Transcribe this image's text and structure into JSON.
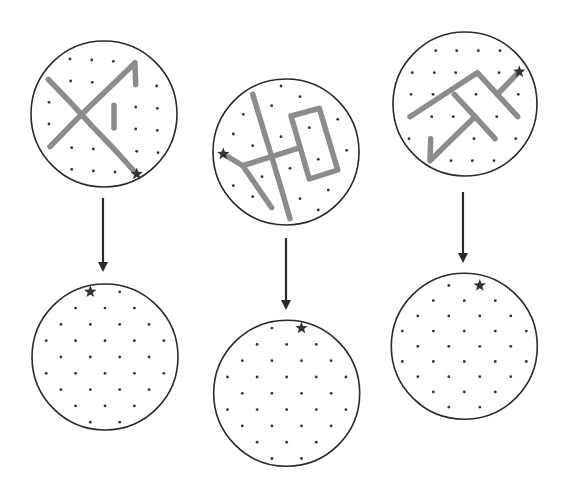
{
  "figure": {
    "width": 565,
    "height": 495,
    "colors": {
      "circle_stroke": "#2a2a2a",
      "dot": "#333333",
      "path_line": "#8c8c8c",
      "star": "#333333",
      "arrow": "#2a2a2a"
    },
    "columns": [
      {
        "id": "col-1",
        "top": {
          "center": [
            104,
            114
          ],
          "r": 73,
          "dots": [
            [
              70,
              59
            ],
            [
              91.7,
              60
            ],
            [
              113.3,
              61.3
            ],
            [
              135,
              62.7
            ],
            [
              48.3,
              79.3
            ],
            [
              70.7,
              81
            ],
            [
              92.3,
              82.3
            ],
            [
              114,
              83.3
            ],
            [
              135.7,
              84.7
            ],
            [
              156.7,
              86
            ],
            [
              49,
              102.3
            ],
            [
              70.7,
              102.7
            ],
            [
              92.3,
              104
            ],
            [
              114,
              105.3
            ],
            [
              135.7,
              107
            ],
            [
              157.3,
              108.3
            ],
            [
              49,
              124
            ],
            [
              70.7,
              125.3
            ],
            [
              92.3,
              126.3
            ],
            [
              114,
              128
            ],
            [
              135.7,
              129
            ],
            [
              157.3,
              130.3
            ],
            [
              50,
              146.7
            ],
            [
              71.7,
              147.7
            ],
            [
              93.3,
              149
            ],
            [
              115,
              150
            ],
            [
              136.7,
              151.3
            ],
            [
              158,
              152.7
            ],
            [
              71.7,
              169.3
            ],
            [
              93.3,
              171
            ],
            [
              115,
              172
            ]
          ],
          "paths": [
            [
              [
                48.3,
                79.3
              ],
              [
                70.7,
                102.7
              ],
              [
                92.3,
                126.3
              ],
              [
                115,
                150
              ],
              [
                136.7,
                174
              ]
            ],
            [
              [
                50,
                146.7
              ],
              [
                70.7,
                125.3
              ],
              [
                92.3,
                104
              ],
              [
                114,
                83.3
              ],
              [
                135,
                62.7
              ],
              [
                135.7,
                84.7
              ]
            ],
            [
              [
                114,
                105.3
              ],
              [
                114,
                128
              ]
            ]
          ],
          "star": [
            136.7,
            174
          ]
        },
        "arrow": {
          "x": 103,
          "y1": 198,
          "y2": 272
        },
        "bottom": {
          "center": [
            105,
            357
          ],
          "r": 73,
          "step": [
            14.7,
            16.3
          ],
          "star_rc": [
            -1,
            -4
          ]
        }
      },
      {
        "id": "col-2",
        "top": {
          "center": [
            286,
            152
          ],
          "r": 73,
          "dots": [
            [
              281,
              86
            ],
            [
              252.7,
              94.3
            ],
            [
              300,
              96.7
            ],
            [
              271.7,
              105.7
            ],
            [
              319.3,
              108.3
            ],
            [
              243.3,
              114.3
            ],
            [
              291,
              116
            ],
            [
              337.7,
              119.3
            ],
            [
              262,
              125
            ],
            [
              309.3,
              127.7
            ],
            [
              233.3,
              134
            ],
            [
              281,
              136.7
            ],
            [
              328.3,
              139.3
            ],
            [
              252.7,
              145.7
            ],
            [
              300,
              147.7
            ],
            [
              346.7,
              150.3
            ],
            [
              271.7,
              156.7
            ],
            [
              318.3,
              159.3
            ],
            [
              242.7,
              165.7
            ],
            [
              290,
              168.3
            ],
            [
              337.7,
              170
            ],
            [
              262,
              176.7
            ],
            [
              309.3,
              179
            ],
            [
              233.3,
              185.7
            ],
            [
              281,
              187.7
            ],
            [
              328.3,
              190
            ],
            [
              252.7,
              196.7
            ],
            [
              300,
              198.7
            ],
            [
              271.7,
              207.7
            ],
            [
              318.3,
              210
            ],
            [
              290,
              218.7
            ]
          ],
          "paths": [
            [
              [
                252.7,
                94.3
              ],
              [
                262,
                125
              ],
              [
                271.7,
                156.7
              ],
              [
                281,
                187.7
              ],
              [
                290,
                218.7
              ]
            ],
            [
              [
                291,
                116
              ],
              [
                319.3,
                108.3
              ],
              [
                337.7,
                170
              ],
              [
                309.3,
                179
              ],
              [
                291,
                116
              ]
            ],
            [
              [
                223.3,
                154
              ],
              [
                242.7,
                165.7
              ],
              [
                271.7,
                156.7
              ],
              [
                300,
                147.7
              ]
            ],
            [
              [
                242.7,
                165.7
              ],
              [
                271.7,
                207.7
              ]
            ]
          ],
          "star": [
            223.3,
            154
          ]
        },
        "arrow": {
          "x": 286,
          "y1": 238,
          "y2": 310
        },
        "bottom": {
          "center": [
            286.7,
            393.3
          ],
          "r": 73,
          "step": [
            14.8,
            16.3
          ],
          "star_rc": [
            1,
            -4
          ]
        }
      },
      {
        "id": "col-3",
        "top": {
          "center": [
            465,
            104
          ],
          "r": 72,
          "dots": [
            [
              435.7,
              50.7
            ],
            [
              456.7,
              50.7
            ],
            [
              478.3,
              50.7
            ],
            [
              500,
              50.7
            ],
            [
              412.3,
              72.7
            ],
            [
              434.3,
              72.7
            ],
            [
              455.7,
              72.7
            ],
            [
              477.3,
              72.7
            ],
            [
              499,
              72.7
            ],
            [
              411,
              94.3
            ],
            [
              433,
              94.3
            ],
            [
              454.3,
              94.3
            ],
            [
              476,
              94.3
            ],
            [
              497.3,
              94.3
            ],
            [
              518.3,
              94.3
            ],
            [
              410,
              116.7
            ],
            [
              431.7,
              116.7
            ],
            [
              453.3,
              116.7
            ],
            [
              475,
              116.7
            ],
            [
              496.7,
              116.7
            ],
            [
              517.7,
              116.7
            ],
            [
              409,
              138.7
            ],
            [
              430.7,
              138.7
            ],
            [
              452.3,
              138.7
            ],
            [
              474,
              138.7
            ],
            [
              495,
              138.7
            ],
            [
              515.7,
              138.7
            ],
            [
              430,
              160.7
            ],
            [
              451,
              160.7
            ],
            [
              472.3,
              160.7
            ],
            [
              494,
              160.7
            ]
          ],
          "paths": [
            [
              [
                410,
                116.7
              ],
              [
                477.3,
                72.7
              ],
              [
                497.3,
                94.3
              ],
              [
                517.7,
                116.7
              ]
            ],
            [
              [
                497.3,
                94.3
              ],
              [
                519.3,
                71.7
              ]
            ],
            [
              [
                454.3,
                94.3
              ],
              [
                475,
                116.7
              ],
              [
                495,
                138.7
              ]
            ],
            [
              [
                430.7,
                138.7
              ],
              [
                430,
                160.7
              ],
              [
                452.3,
                138.7
              ],
              [
                475,
                116.7
              ]
            ]
          ],
          "star": [
            519.3,
            71.7
          ]
        },
        "arrow": {
          "x": 463,
          "y1": 192,
          "y2": 263
        },
        "bottom": {
          "center": [
            464.3,
            346.3
          ],
          "r": 73,
          "step": [
            15.5,
            15.2
          ],
          "star_rc": [
            1,
            -4
          ]
        }
      }
    ],
    "hex_rows": [
      {
        "r": -4,
        "cols": [
          -1,
          1
        ]
      },
      {
        "r": -3,
        "cols": [
          -2,
          0,
          2
        ]
      },
      {
        "r": -2,
        "cols": [
          -3,
          -1,
          1,
          3
        ]
      },
      {
        "r": -1,
        "cols": [
          -4,
          -2,
          0,
          2,
          4
        ]
      },
      {
        "r": 0,
        "cols": [
          -3,
          -1,
          1,
          3
        ]
      },
      {
        "r": 1,
        "cols": [
          -4,
          -2,
          0,
          2,
          4
        ]
      },
      {
        "r": 2,
        "cols": [
          -3,
          -1,
          1,
          3
        ]
      },
      {
        "r": 3,
        "cols": [
          -2,
          0,
          2
        ]
      },
      {
        "r": 4,
        "cols": [
          -1,
          1
        ]
      }
    ]
  }
}
